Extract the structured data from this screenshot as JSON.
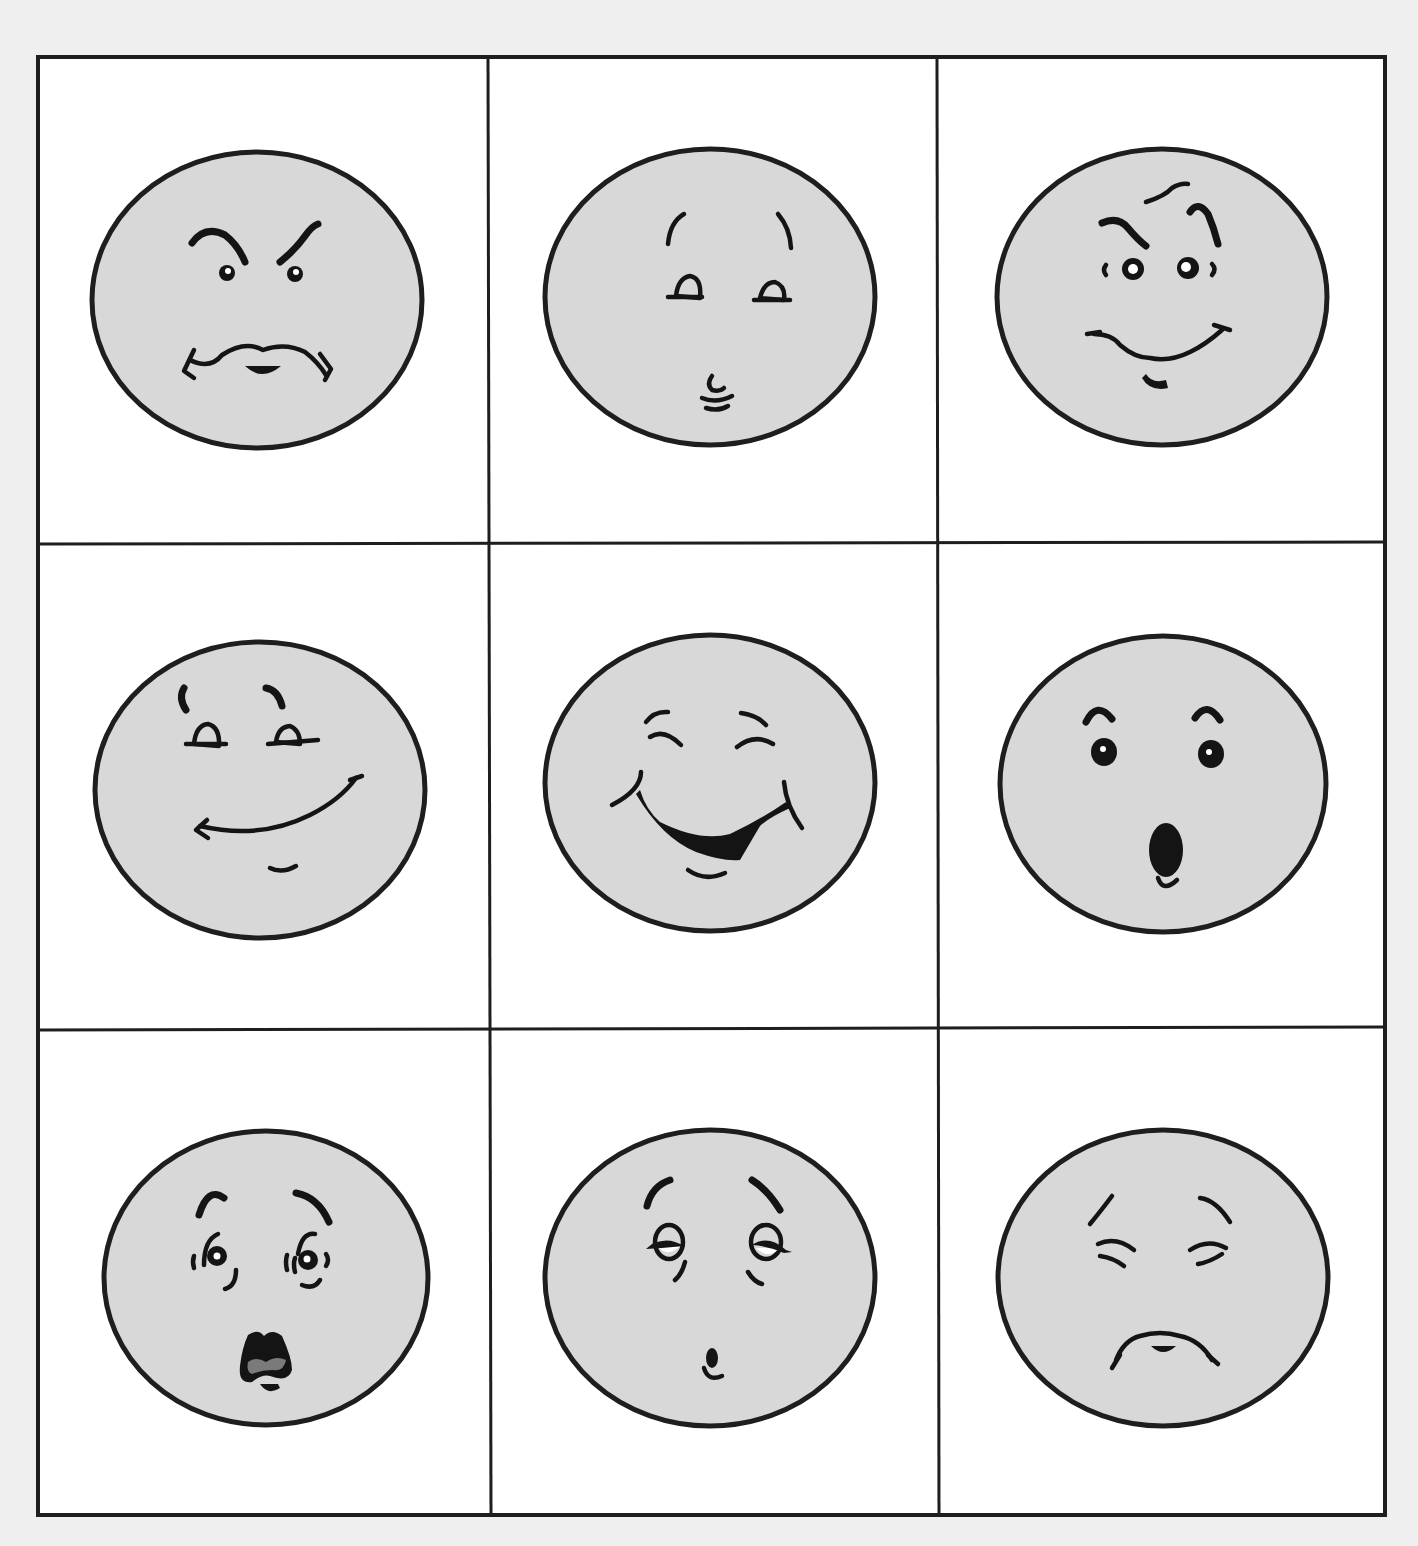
{
  "worksheet": {
    "title": "",
    "grid": {
      "rows": 3,
      "columns": 3,
      "background": "#efefef",
      "cell_color": "#ffffff",
      "line_color": "#1e1e1e"
    },
    "face_fill": "#d8d8d8",
    "cells": [
      {
        "row": 1,
        "col": 1,
        "expression": "angry"
      },
      {
        "row": 1,
        "col": 2,
        "expression": "unsure"
      },
      {
        "row": 1,
        "col": 3,
        "expression": "mischievous"
      },
      {
        "row": 2,
        "col": 1,
        "expression": "content"
      },
      {
        "row": 2,
        "col": 2,
        "expression": "laughing"
      },
      {
        "row": 2,
        "col": 3,
        "expression": "surprised"
      },
      {
        "row": 3,
        "col": 1,
        "expression": "shocked"
      },
      {
        "row": 3,
        "col": 2,
        "expression": "tired"
      },
      {
        "row": 3,
        "col": 3,
        "expression": "sad"
      }
    ]
  }
}
